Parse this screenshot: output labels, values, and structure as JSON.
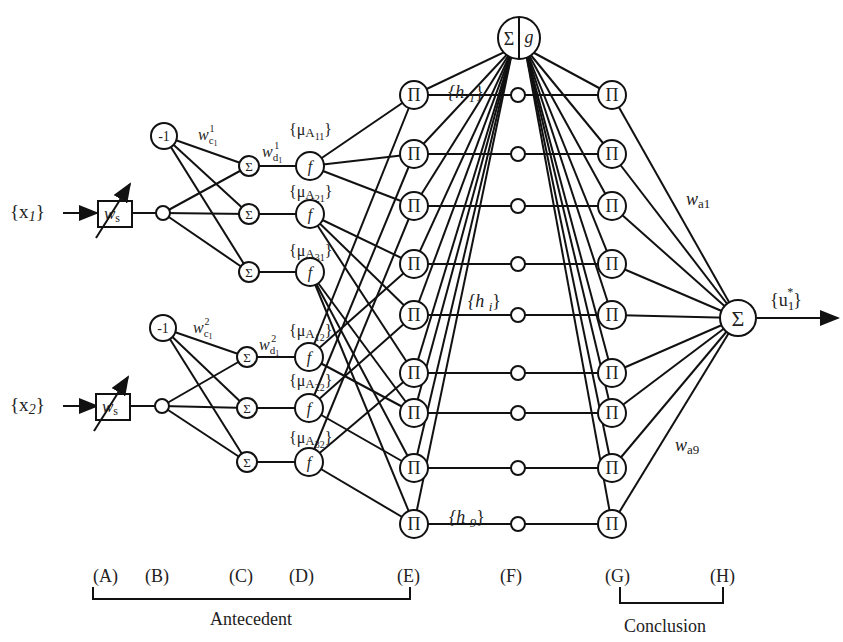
{
  "inputs": [
    {
      "label": "{x",
      "sub": "1",
      "close": "}"
    },
    {
      "label": "{x",
      "sub": "2",
      "close": "}"
    }
  ],
  "scaling_weight": {
    "label": "w",
    "sub": "s"
  },
  "bias_node": "-1",
  "weights": {
    "wc1": {
      "base": "w",
      "sub": "c",
      "subsub": "1",
      "sup": "1"
    },
    "wd1": {
      "base": "w",
      "sub": "d",
      "subsub": "1",
      "sup": "1"
    },
    "wc2": {
      "base": "w",
      "sub": "c",
      "subsub": "1",
      "sup": "2"
    },
    "wd2": {
      "base": "w",
      "sub": "d",
      "subsub": "1",
      "sup": "2"
    },
    "wa1": {
      "base": "w",
      "sub": "a1"
    },
    "wa9": {
      "base": "w",
      "sub": "a9"
    }
  },
  "sum_symbol": "Σ",
  "prod_symbol": "Π",
  "func_symbol": "f",
  "norm_node": {
    "left": "Σ",
    "right": "g"
  },
  "membership_labels": [
    "{μA11}",
    "{μA21}",
    "{μA31}",
    "{μA12}",
    "{μA22}",
    "{μA32}"
  ],
  "membership": [
    {
      "pre": "{μ",
      "A": "A",
      "idx": "11",
      "close": "}"
    },
    {
      "pre": "{μ",
      "A": "A",
      "idx": "21",
      "close": "}"
    },
    {
      "pre": "{μ",
      "A": "A",
      "idx": "31",
      "close": "}"
    },
    {
      "pre": "{μ",
      "A": "A",
      "idx": "12",
      "close": "}"
    },
    {
      "pre": "{μ",
      "A": "A",
      "idx": "22",
      "close": "}"
    },
    {
      "pre": "{μ",
      "A": "A",
      "idx": "32",
      "close": "}"
    }
  ],
  "h_labels": {
    "h1": {
      "pre": "{h ",
      "sub": "1",
      "close": "}"
    },
    "hi": {
      "pre": "{h ",
      "sub": "i",
      "close": "}"
    },
    "h9": {
      "pre": "{h ",
      "sub": "9",
      "close": "}"
    }
  },
  "output": {
    "pre": "{u",
    "sub": "1",
    "sup": "*",
    "close": "}"
  },
  "layers": [
    "(A)",
    "(B)",
    "(C)",
    "(D)",
    "(E)",
    "(F)",
    "(G)",
    "(H)"
  ],
  "groups": {
    "antecedent": "Antecedent",
    "conclusion": "Conclusion"
  },
  "colors": {
    "ink": "#111111",
    "text": "#222222",
    "background": "#ffffff"
  }
}
